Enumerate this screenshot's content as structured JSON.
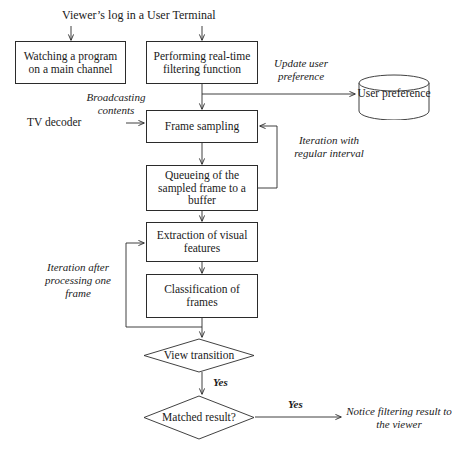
{
  "diagram": {
    "title": "Viewer’s log in a User Terminal",
    "nodes": {
      "watching": "Watching a program on a main channel",
      "performing": "Performing real-time filtering function",
      "user_preference": "User preference",
      "frame_sampling": "Frame sampling",
      "queueing": "Queueing of  the sampled frame to a buffer",
      "extraction": "Extraction of visual features",
      "classification": "Classification of frames",
      "view_transition": "View transition",
      "matched_result": "Matched result?"
    },
    "edge_labels": {
      "update_user_preference": "Update user preference",
      "broadcasting_contents": "Broadcasting contents",
      "tv_decoder": "TV decoder",
      "iteration_regular": "Iteration with regular interval",
      "iteration_after": "Iteration after processing one frame",
      "yes_view_transition": "Yes",
      "yes_matched": "Yes",
      "notice": "Notice filtering result to the viewer"
    },
    "colors": {
      "stroke": "#2b2b2b",
      "background": "#ffffff",
      "text": "#1a1a1a"
    }
  }
}
